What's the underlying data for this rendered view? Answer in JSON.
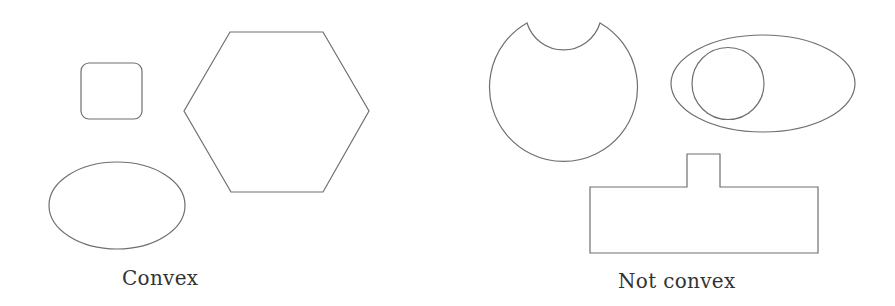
{
  "figure": {
    "stroke_color": "#6f6f6f",
    "background": "#ffffff",
    "groups": [
      {
        "caption": "Convex",
        "shapes": [
          {
            "kind": "rounded-square"
          },
          {
            "kind": "hexagon"
          },
          {
            "kind": "ellipse"
          }
        ]
      },
      {
        "caption": "Not convex",
        "shapes": [
          {
            "kind": "circle-with-bite"
          },
          {
            "kind": "ellipse-containing-circle"
          },
          {
            "kind": "rectangle-with-tab"
          }
        ]
      }
    ]
  }
}
